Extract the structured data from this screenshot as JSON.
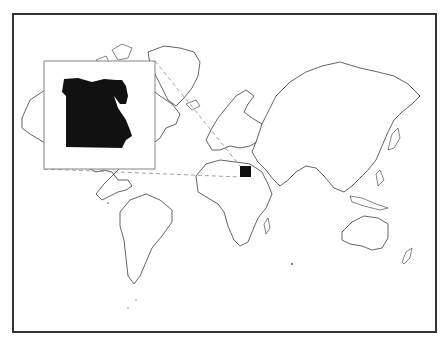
{
  "map": {
    "type": "locator-map",
    "projection": "world outline",
    "highlighted_country": "Egypt",
    "colors": {
      "frame": "#333333",
      "land_fill": "#ffffff",
      "land_stroke": "#222222",
      "highlight": "#111111",
      "leader_lines": "#888888",
      "inset_border": "#777777"
    },
    "inset": {
      "subject": "Egypt",
      "position": "upper-left"
    }
  }
}
